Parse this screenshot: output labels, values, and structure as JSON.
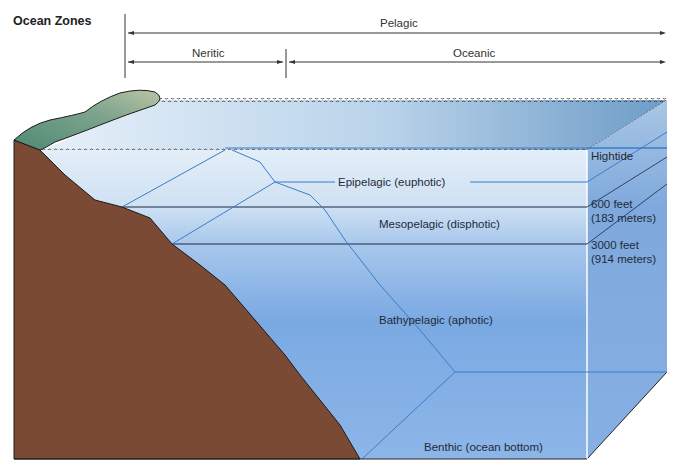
{
  "title": "Ocean Zones",
  "horizontal_zones": {
    "pelagic": "Pelagic",
    "neritic": "Neritic",
    "oceanic": "Oceanic"
  },
  "vertical_zones": {
    "epipelagic": "Epipelagic (euphotic)",
    "mesopelagic": "Mesopelagic (disphotic)",
    "bathypelagic": "Bathypelagic (aphotic)",
    "benthic": "Benthic (ocean bottom)"
  },
  "depth_markers": {
    "hightide": "Hightide",
    "depth1_feet": "600 feet",
    "depth1_meters": "(183 meters)",
    "depth2_feet": "3000 feet",
    "depth2_meters": "(914 meters)"
  },
  "colors": {
    "land": "#7a4a35",
    "vegetation": "#6f9a86",
    "water_light": "#dbe9f6",
    "water_deep": "#5b92d6",
    "zone_line": "#3b7dc9",
    "boundary_line": "#1a2a44"
  }
}
